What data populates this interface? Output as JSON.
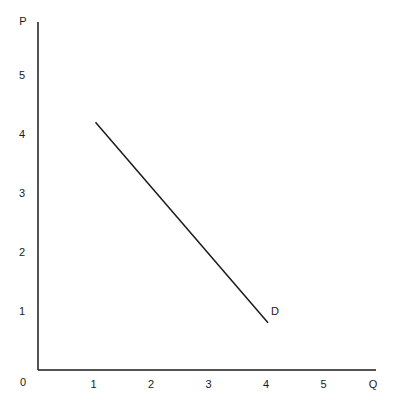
{
  "chart_data": {
    "type": "line",
    "title": "",
    "xlabel": "Q",
    "ylabel": "P",
    "origin_label": "0",
    "xlim": [
      0,
      6
    ],
    "ylim": [
      0,
      6
    ],
    "x_ticks": [
      "1",
      "2",
      "3",
      "4",
      "5"
    ],
    "y_ticks": [
      "1",
      "2",
      "3",
      "4",
      "5"
    ],
    "grid": false,
    "series": [
      {
        "name": "D",
        "label": "D",
        "x": [
          1,
          4
        ],
        "y": [
          4.2,
          0.8
        ],
        "color": "#1a1a1a"
      }
    ]
  }
}
